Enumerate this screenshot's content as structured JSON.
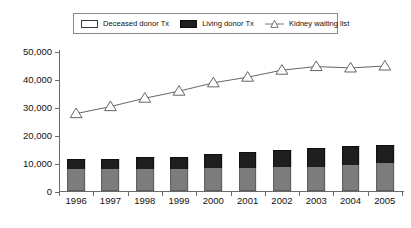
{
  "legend": {
    "position": "top",
    "items": [
      {
        "label": "Deceased donor Tx",
        "marker": "square-swatch",
        "color": "#7c7c7c"
      },
      {
        "label": "Living donor Tx",
        "marker": "square-swatch",
        "color": "#1e1e1e"
      },
      {
        "label": "Kidney waiting list",
        "marker": "triangle-line-marker",
        "color": "#ffffff"
      }
    ]
  },
  "chart_data": {
    "type": "bar",
    "title": "",
    "subtitle": "",
    "xlabel": "",
    "ylabel": "",
    "categories": [
      "1996",
      "1997",
      "1998",
      "1999",
      "2000",
      "2001",
      "2002",
      "2003",
      "2004",
      "2005"
    ],
    "ylim": [
      0,
      50000
    ],
    "yticks": [
      0,
      10000,
      20000,
      30000,
      40000,
      50000
    ],
    "ytick_labels": [
      "0",
      "10,000",
      "20,000",
      "30,000",
      "40,000",
      "50,000"
    ],
    "grid": false,
    "stacked": true,
    "series": [
      {
        "name": "Deceased donor Tx",
        "type": "bar",
        "color": "#7c7c7c",
        "values": [
          8000,
          8000,
          8000,
          8000,
          8100,
          8200,
          8500,
          8700,
          9400,
          9900
        ]
      },
      {
        "name": "Living donor Tx",
        "type": "bar",
        "color": "#1e1e1e",
        "values": [
          3500,
          3600,
          4000,
          4300,
          5000,
          5600,
          6200,
          6500,
          6600,
          6600
        ]
      },
      {
        "name": "Kidney waiting list",
        "type": "line",
        "color": "#ffffff",
        "marker": "triangle",
        "values": [
          28000,
          30500,
          33500,
          36000,
          39000,
          41000,
          43500,
          44800,
          44300,
          45000
        ]
      }
    ]
  }
}
